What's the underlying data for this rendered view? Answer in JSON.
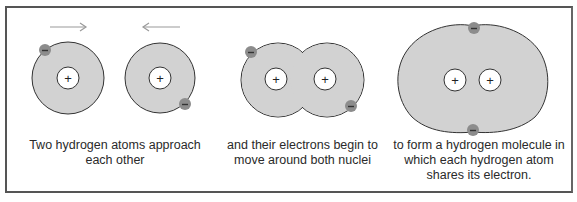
{
  "colors": {
    "cloud_fill": "#d2d2d2",
    "cloud_stroke": "#333333",
    "electron_fill": "#8c8c8c",
    "nucleus_fill": "#ffffff",
    "arrow": "#9a9a9a",
    "frame": "#555555",
    "text": "#2a2a2a"
  },
  "symbols": {
    "nucleus": "+",
    "electron": "–"
  },
  "panels": [
    {
      "id": "approach",
      "caption_lines": [
        "Two hydrogen atoms approach",
        "each other"
      ],
      "arrows": [
        {
          "direction": "right",
          "icon": "arrow-right-icon"
        },
        {
          "direction": "left",
          "icon": "arrow-left-icon"
        }
      ]
    },
    {
      "id": "overlap",
      "caption_lines": [
        "and their electrons begin to",
        "move around both nuclei"
      ]
    },
    {
      "id": "molecule",
      "caption_lines": [
        "to form a hydrogen molecule in",
        "which each hydrogen atom",
        "shares its electron."
      ]
    }
  ]
}
